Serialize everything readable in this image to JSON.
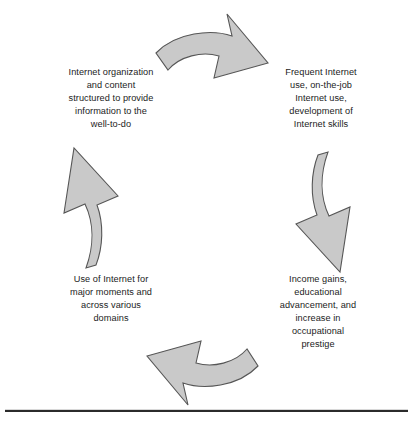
{
  "diagram": {
    "type": "cycle",
    "direction": "clockwise",
    "stage_count": 4,
    "colors": {
      "arrow_fill": "#c9c9c9",
      "arrow_outline": "#565656",
      "text": "#1c1c1c",
      "background": "#ffffff",
      "rule": "#2b2b2b"
    },
    "stages": [
      {
        "id": "frequent-use",
        "position": "top-right",
        "text": "Frequent Internet\nuse, on-the-job\nInternet use,\ndevelopment of\nInternet skills"
      },
      {
        "id": "income-gains",
        "position": "bottom-right",
        "text": "Income gains,\neducational\nadvancement, and\nincrease in\noccupational\nprestige"
      },
      {
        "id": "use-domains",
        "position": "bottom-left",
        "text": "Use of Internet for\nmajor moments and\nacross various\ndomains"
      },
      {
        "id": "organization",
        "position": "top-left",
        "text": "Internet organization\nand content\nstructured to provide\ninformation to the\nwell-to-do"
      }
    ],
    "arrows": [
      {
        "id": "arrow-top",
        "points_to": "frequent-use",
        "direction": "right-down"
      },
      {
        "id": "arrow-right",
        "points_to": "income-gains",
        "direction": "down-left"
      },
      {
        "id": "arrow-bottom",
        "points_to": "use-domains",
        "direction": "left-up"
      },
      {
        "id": "arrow-left",
        "points_to": "organization",
        "direction": "up-right"
      }
    ]
  }
}
